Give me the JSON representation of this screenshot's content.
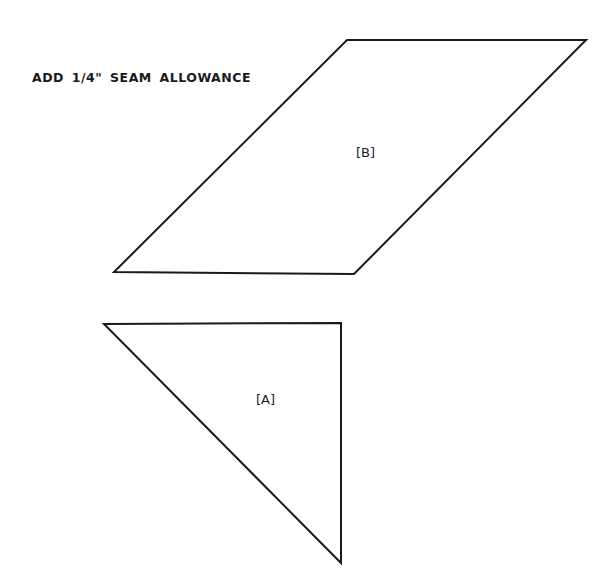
{
  "instruction": "ADD 1/4\" SEAM ALLOWANCE",
  "pieces": [
    {
      "id": "B",
      "label": "[B]",
      "shape": "parallelogram",
      "points": "347,40 586,40 354,274 114,272",
      "label_pos": [
        356,
        145
      ]
    },
    {
      "id": "A",
      "label": "[A]",
      "shape": "right-triangle",
      "points": "104,324 341,323 341,563",
      "label_pos": [
        256,
        392
      ]
    }
  ],
  "colors": {
    "stroke": "#1a1a1a",
    "background": "#ffffff"
  }
}
